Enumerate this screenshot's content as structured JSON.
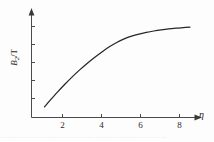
{
  "figure": {
    "background_color": "#fdfdfd",
    "line_color": "#262626",
    "axis_color": "#4a4a4a",
    "text_color": "#1f1f1f"
  },
  "axes": {
    "y": {
      "label_main": "B",
      "label_sub": "2",
      "label_slash": "/",
      "label_unit": "T",
      "tick_labels": [],
      "arrow": "up-arrow-icon"
    },
    "x": {
      "label": "η",
      "tick_labels": [
        "2",
        "4",
        "6",
        "8"
      ],
      "arrow": "right-arrow-icon"
    }
  },
  "caption": {
    "text": "·····························································"
  },
  "chart_data": {
    "type": "line",
    "title": "",
    "subtitle": "",
    "xlabel": "η",
    "ylabel": "B₂/T",
    "xlim": [
      0,
      9.2
    ],
    "ylim": [
      0,
      1.12
    ],
    "xticks": [
      2,
      4,
      6,
      8
    ],
    "yticks": [],
    "grid": false,
    "legend": null,
    "series": [
      {
        "name": "B2/T vs eta",
        "x": [
          0.7,
          1.0,
          1.4,
          1.8,
          2.2,
          2.6,
          3.0,
          3.4,
          3.8,
          4.2,
          4.6,
          5.0,
          5.4,
          5.8,
          6.2,
          6.6,
          7.0,
          7.4,
          7.8,
          8.2,
          8.55
        ],
        "y": [
          0.115,
          0.185,
          0.275,
          0.36,
          0.44,
          0.515,
          0.585,
          0.65,
          0.71,
          0.765,
          0.812,
          0.85,
          0.88,
          0.903,
          0.921,
          0.936,
          0.948,
          0.958,
          0.966,
          0.973,
          0.978
        ]
      }
    ],
    "annotations": []
  }
}
